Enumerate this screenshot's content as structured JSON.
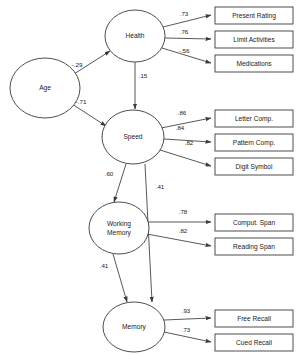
{
  "diagram": {
    "type": "sem-path-diagram",
    "latent_variables": [
      {
        "id": "age",
        "label": "Age",
        "cx": 45,
        "cy": 88,
        "rx": 35,
        "ry": 30
      },
      {
        "id": "health",
        "label": "Health",
        "cx": 135,
        "cy": 36,
        "rx": 30,
        "ry": 26
      },
      {
        "id": "speed",
        "label": "Speed",
        "cx": 133,
        "cy": 137,
        "rx": 31,
        "ry": 27
      },
      {
        "id": "wm",
        "label": "Working",
        "label2": "Memory",
        "cx": 119,
        "cy": 228,
        "rx": 30,
        "ry": 26
      },
      {
        "id": "memory",
        "label": "Memory",
        "cx": 134,
        "cy": 327,
        "rx": 31,
        "ry": 25
      }
    ],
    "observed_variables": [
      {
        "id": "present_rating",
        "label": "Present Rating",
        "x": 215,
        "y": 7,
        "w": 78,
        "h": 17
      },
      {
        "id": "limit_act",
        "label": "Limit Activities",
        "x": 215,
        "y": 31,
        "w": 78,
        "h": 17
      },
      {
        "id": "medications",
        "label": "Medications",
        "x": 215,
        "y": 55,
        "w": 78,
        "h": 17
      },
      {
        "id": "letter_comp",
        "label": "Letter Comp.",
        "x": 215,
        "y": 110,
        "w": 78,
        "h": 17
      },
      {
        "id": "pattern_comp",
        "label": "Pattern Comp.",
        "x": 215,
        "y": 134,
        "w": 78,
        "h": 17
      },
      {
        "id": "digit_symbol",
        "label": "Digit Symbol",
        "x": 215,
        "y": 158,
        "w": 78,
        "h": 17
      },
      {
        "id": "comput_span",
        "label": "Comput. Span",
        "x": 215,
        "y": 214,
        "w": 78,
        "h": 17
      },
      {
        "id": "reading_span",
        "label": "Reading Span",
        "x": 215,
        "y": 238,
        "w": 78,
        "h": 17
      },
      {
        "id": "free_recall",
        "label": "Free Recall",
        "x": 215,
        "y": 310,
        "w": 78,
        "h": 17
      },
      {
        "id": "cued_recall",
        "label": "Cued Recall",
        "x": 215,
        "y": 334,
        "w": 78,
        "h": 17
      }
    ],
    "structural_paths": [
      {
        "id": "age-health",
        "from": "age",
        "to": "health",
        "coef": "-.29",
        "x1": 74,
        "y1": 74,
        "x2": 110,
        "y2": 51,
        "lx": 77,
        "ly": 65
      },
      {
        "id": "age-speed",
        "from": "age",
        "to": "speed",
        "coef": "-.71",
        "x1": 72,
        "y1": 104,
        "x2": 106,
        "y2": 126,
        "lx": 81,
        "ly": 102
      },
      {
        "id": "health-speed",
        "from": "health",
        "to": "speed",
        "coef": ".15",
        "x1": 135,
        "y1": 62,
        "x2": 135,
        "y2": 109,
        "lx": 143,
        "ly": 76
      },
      {
        "id": "speed-wm",
        "from": "speed",
        "to": "wm",
        "coef": ".60",
        "x1": 126,
        "y1": 164,
        "x2": 114,
        "y2": 202,
        "lx": 109,
        "ly": 174
      },
      {
        "id": "speed-memory",
        "from": "speed",
        "to": "memory",
        "coef": ".41",
        "x1": 145,
        "y1": 164,
        "x2": 152,
        "y2": 302,
        "lx": 160,
        "ly": 187
      },
      {
        "id": "wm-memory",
        "from": "wm",
        "to": "memory",
        "coef": ".41",
        "x1": 113,
        "y1": 254,
        "x2": 127,
        "y2": 302,
        "lx": 104,
        "ly": 266
      }
    ],
    "measurement_paths": [
      {
        "id": "health-present",
        "from": "health",
        "to": "present_rating",
        "coef": ".73",
        "x1": 163,
        "y1": 27,
        "x2": 211,
        "y2": 15,
        "lx": 184,
        "ly": 14
      },
      {
        "id": "health-limit",
        "from": "health",
        "to": "limit_act",
        "coef": ".76",
        "x1": 165,
        "y1": 38,
        "x2": 211,
        "y2": 39,
        "lx": 184,
        "ly": 32
      },
      {
        "id": "health-meds",
        "from": "health",
        "to": "medications",
        "coef": "-.56",
        "x1": 162,
        "y1": 48,
        "x2": 211,
        "y2": 63,
        "lx": 184,
        "ly": 51
      },
      {
        "id": "speed-letter",
        "from": "speed",
        "to": "letter_comp",
        "coef": ".86",
        "x1": 161,
        "y1": 128,
        "x2": 211,
        "y2": 118,
        "lx": 182,
        "ly": 113
      },
      {
        "id": "speed-pattern",
        "from": "speed",
        "to": "pattern_comp",
        "coef": ".84",
        "x1": 164,
        "y1": 139,
        "x2": 211,
        "y2": 142,
        "lx": 180,
        "ly": 128
      },
      {
        "id": "speed-digit",
        "from": "speed",
        "to": "digit_symbol",
        "coef": ".82",
        "x1": 160,
        "y1": 150,
        "x2": 211,
        "y2": 166,
        "lx": 189,
        "ly": 143
      },
      {
        "id": "wm-comput",
        "from": "wm",
        "to": "comput_span",
        "coef": ".78",
        "x1": 148,
        "y1": 222,
        "x2": 211,
        "y2": 222,
        "lx": 183,
        "ly": 212
      },
      {
        "id": "wm-reading",
        "from": "wm",
        "to": "reading_span",
        "coef": ".82",
        "x1": 147,
        "y1": 234,
        "x2": 211,
        "y2": 246,
        "lx": 183,
        "ly": 231
      },
      {
        "id": "memory-free",
        "from": "memory",
        "to": "free_recall",
        "coef": ".93",
        "x1": 164,
        "y1": 320,
        "x2": 211,
        "y2": 318,
        "lx": 186,
        "ly": 311
      },
      {
        "id": "memory-cued",
        "from": "memory",
        "to": "cued_recall",
        "coef": ".73",
        "x1": 164,
        "y1": 332,
        "x2": 211,
        "y2": 342,
        "lx": 186,
        "ly": 330
      }
    ],
    "colors": {
      "stroke": "#3a3a3a",
      "text": "#1a1a1a",
      "background": "#ffffff"
    }
  }
}
